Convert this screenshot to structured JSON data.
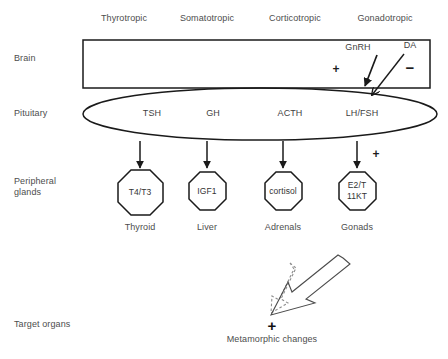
{
  "figure": {
    "colors": {
      "stroke": "#1a1a1a",
      "text": "#4a4a4a",
      "background": "#ffffff",
      "dashed_arrow": "#8a8a8a"
    }
  },
  "row_labels": [
    {
      "name": "brain",
      "label": "Brain"
    },
    {
      "name": "pituitary",
      "label": "Pituitary"
    },
    {
      "name": "peripheral-glands",
      "label": "Peripheral\nglands"
    },
    {
      "name": "target-organs",
      "label": "Target organs"
    }
  ],
  "axes": [
    {
      "name": "thyrotropic",
      "label": "Thyrotropic"
    },
    {
      "name": "somatotropic",
      "label": "Somatotropic"
    },
    {
      "name": "corticotropic",
      "label": "Corticotropic"
    },
    {
      "name": "gonadotropic",
      "label": "Gonadotropic"
    }
  ],
  "brain_factors": [
    {
      "name": "gnrh",
      "label": "GnRH",
      "sign": "+"
    },
    {
      "name": "dopamine",
      "label": "DA",
      "sign": "−"
    }
  ],
  "pituitary_hormones": [
    {
      "name": "tsh",
      "label": "TSH"
    },
    {
      "name": "gh",
      "label": "GH"
    },
    {
      "name": "acth",
      "label": "ACTH"
    },
    {
      "name": "lh-fsh",
      "label": "LH/FSH"
    }
  ],
  "glands": [
    {
      "name": "thyroid",
      "product_line1": "T4/T3",
      "product_line2": "",
      "organ": "Thyroid"
    },
    {
      "name": "liver",
      "product_line1": "IGF1",
      "product_line2": "",
      "organ": "Liver"
    },
    {
      "name": "adrenals",
      "product_line1": "cortisol",
      "product_line2": "",
      "organ": "Adrenals"
    },
    {
      "name": "gonads",
      "product_line1": "E2/T",
      "product_line2": "11KT",
      "organ": "Gonads"
    }
  ],
  "gonad_stimulation_sign": "+",
  "outcome": {
    "name": "metamorphic-changes",
    "label": "Metamorphic changes",
    "sign": "+"
  }
}
